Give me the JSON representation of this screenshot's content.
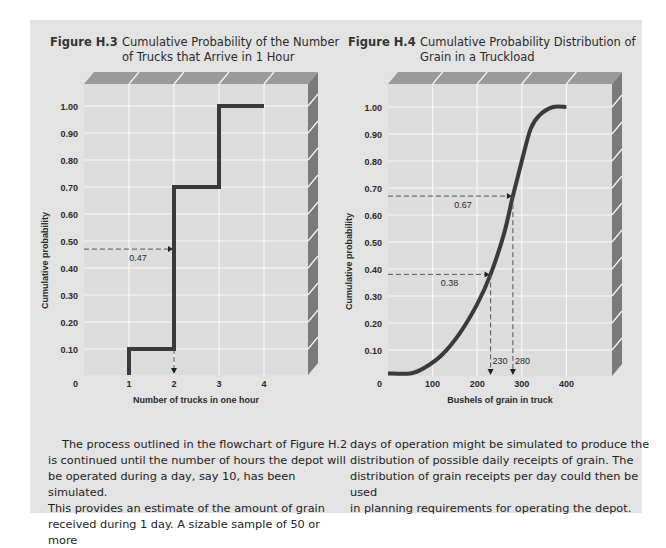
{
  "colors": {
    "panel_bg": "#e3e3e3",
    "plot_bg": "#dcdcdc",
    "grid": "#f7f7f7",
    "top_face": "#9a9a9a",
    "side_face": "#7a7a7a",
    "curve": "#3a3a3a",
    "guide": "#555555"
  },
  "figures": [
    {
      "number": "Figure H.3",
      "title_line1": "Cumulative Probability of the Number",
      "title_line2": "of Trucks that Arrive in 1 Hour"
    },
    {
      "number": "Figure H.4",
      "title_line1": "Cumulative Probability Distribution of",
      "title_line2": "Grain in a Truckload"
    }
  ],
  "body_text": {
    "left": [
      "The process outlined in the flowchart of Figure H.2",
      "is continued until the number of hours the depot will",
      "be operated during a day, say 10, has been simulated.",
      "This provides an estimate of the amount of grain",
      "received during 1 day. A sizable sample of 50 or more"
    ],
    "right": [
      "days of operation might be simulated to produce the",
      "distribution of possible daily receipts of grain. The",
      "distribution of grain receipts per day could then be used",
      "in planning requirements for operating the depot."
    ]
  },
  "chart_data": [
    {
      "type": "line",
      "subtype": "step",
      "title": "Cumulative Probability of the Number of Trucks that Arrive in 1 Hour",
      "xlabel": "Number of trucks in one hour",
      "ylabel": "Cumulative probability",
      "xlim": [
        0,
        5
      ],
      "ylim": [
        0,
        1.0
      ],
      "x_ticks": [
        "0",
        "1",
        "2",
        "3",
        "4"
      ],
      "y_ticks": [
        "0.10",
        "0.20",
        "0.30",
        "0.40",
        "0.50",
        "0.60",
        "0.70",
        "0.80",
        "0.90",
        "1.00"
      ],
      "grid": true,
      "points": [
        [
          1,
          0
        ],
        [
          1,
          0.1
        ],
        [
          2,
          0.1
        ],
        [
          2,
          0.7
        ],
        [
          3,
          0.7
        ],
        [
          3,
          1.0
        ],
        [
          4,
          1.0
        ]
      ],
      "annotations": [
        {
          "label": "0.47",
          "y": 0.47,
          "x": 2
        }
      ]
    },
    {
      "type": "line",
      "subtype": "s-curve",
      "title": "Cumulative Probability Distribution of Grain in a Truckload",
      "xlabel": "Bushels of grain in truck",
      "ylabel": "Cumulative probability",
      "xlim": [
        0,
        500
      ],
      "ylim": [
        0,
        1.0
      ],
      "x_ticks": [
        "0",
        "100",
        "200",
        "300",
        "400"
      ],
      "y_ticks": [
        "0.10",
        "0.20",
        "0.30",
        "0.40",
        "0.50",
        "0.60",
        "0.70",
        "0.80",
        "0.90",
        "1.00"
      ],
      "grid": true,
      "points": [
        [
          0,
          0.01
        ],
        [
          50,
          0.01
        ],
        [
          80,
          0.03
        ],
        [
          120,
          0.08
        ],
        [
          160,
          0.16
        ],
        [
          200,
          0.27
        ],
        [
          230,
          0.38
        ],
        [
          260,
          0.53
        ],
        [
          280,
          0.67
        ],
        [
          300,
          0.8
        ],
        [
          320,
          0.92
        ],
        [
          340,
          0.97
        ],
        [
          370,
          1.0
        ],
        [
          400,
          1.0
        ]
      ],
      "annotations": [
        {
          "label": "0.38",
          "y": 0.38,
          "x": 230,
          "x_label": "230"
        },
        {
          "label": "0.67",
          "y": 0.67,
          "x": 280,
          "x_label": "280"
        }
      ]
    }
  ]
}
